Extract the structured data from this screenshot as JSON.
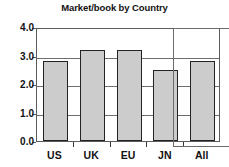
{
  "chart_data": {
    "type": "bar",
    "title": "Market/book by Country",
    "xlabel": "",
    "ylabel": "",
    "categories": [
      "US",
      "UK",
      "EU",
      "JN",
      "All"
    ],
    "values": [
      2.8,
      3.2,
      3.2,
      2.5,
      2.8
    ],
    "ylim": [
      0.0,
      4.0
    ],
    "ytick_labels": [
      "0.0",
      "1.0",
      "2.0",
      "3.0",
      "4.0"
    ],
    "ytick_values": [
      0.0,
      1.0,
      2.0,
      3.0,
      4.0
    ],
    "grid": true,
    "grid_axis": "y",
    "legend": null,
    "legend_position": "none",
    "bar_fill_color": "#cccccc",
    "bar_border_color": "#232323",
    "plot_border_color": "#5c5c5c",
    "gridline_color": "#6e6e6e",
    "annotations": [
      {
        "type": "highlight-rectangle",
        "target_category": "All",
        "color": "#6b6b6b"
      }
    ]
  }
}
